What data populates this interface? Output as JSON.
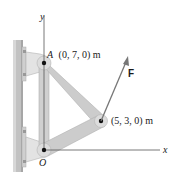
{
  "diagram": {
    "axes": {
      "y_label": "y",
      "x_label": "x",
      "origin_label": "O"
    },
    "points": [
      {
        "name": "A",
        "label": "A",
        "coords": "(0, 7, 0) m"
      },
      {
        "name": "B",
        "label": "",
        "coords": "(5, 3, 0) m"
      }
    ],
    "force": {
      "label": "F"
    },
    "colors": {
      "wall": "#c4c4c4",
      "wall_dark": "#a8a8a8",
      "member": "#cfcfcf",
      "member_edge": "#b5b5b5",
      "bracket": "#e2e2e2",
      "axis": "#555555",
      "force": "#777777"
    }
  }
}
